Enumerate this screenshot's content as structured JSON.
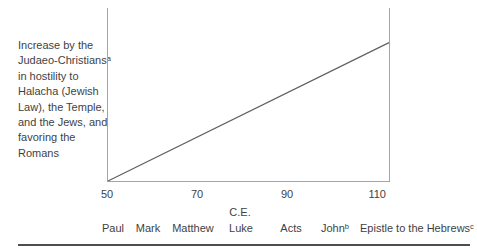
{
  "chart_data": {
    "type": "line",
    "title": "",
    "xlabel": "C.E.",
    "ylabel": "Increase by the\nJudaeo-Christiansᵃ\nin hostility to\nHalacha (Jewish\nLaw), the Temple,\nand the Jews, and\nfavoring the\nRomans",
    "xlim": [
      50,
      112.4
    ],
    "ylim": [
      0,
      1
    ],
    "x_ticks": [
      50,
      70,
      90,
      110
    ],
    "y_ticks": [],
    "grid": false,
    "legend": "none",
    "axes_drawn": [
      "left",
      "right",
      "bottom"
    ],
    "series": [
      {
        "name": "hostility-increase-trend",
        "points": [
          {
            "x": 50,
            "y": 0
          },
          {
            "x": 112.4,
            "y": 0.8
          }
        ]
      }
    ],
    "writings": [
      {
        "label": "Paul",
        "x_px": 6
      },
      {
        "label": "Mark",
        "x_px": 41
      },
      {
        "label": "Matthew",
        "x_px": 86
      },
      {
        "label": "Luke",
        "x_px": 134
      },
      {
        "label": "Acts",
        "x_px": 184
      },
      {
        "label": "Johnᵇ",
        "x_px": 228
      },
      {
        "label": "Epistle to the Hebrewsᶜ",
        "x_px": 310
      }
    ],
    "xlabel_x_px": 133
  },
  "colors": {
    "background": "#ffffff",
    "axis": "#a5a5a5",
    "trend_line": "#606060",
    "text": "#3f3f3f",
    "bottom_rule": "#4d4d4d"
  }
}
